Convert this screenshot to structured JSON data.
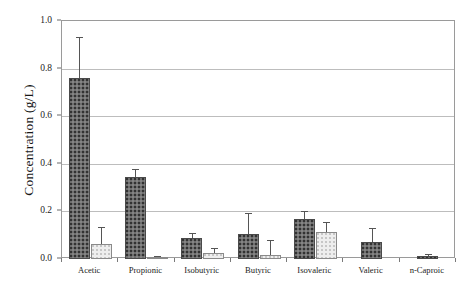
{
  "chart_data": {
    "type": "bar",
    "title": "",
    "xlabel": "",
    "ylabel": "Concentration (g/L)",
    "ylim": [
      0.0,
      1.0
    ],
    "yticks": [
      "0.0",
      "0.2",
      "0.4",
      "0.6",
      "0.8",
      "1.0"
    ],
    "ytick_values": [
      0.0,
      0.2,
      0.4,
      0.6,
      0.8,
      1.0
    ],
    "grid": "horizontal",
    "legend_position": "none",
    "categories": [
      "Acetic",
      "Propionic",
      "Isobutyric",
      "Butyric",
      "Isovaleric",
      "Valeric",
      "n-Caproic"
    ],
    "series": [
      {
        "name": "series-1",
        "style": "dark-speckled",
        "color": "#6e6e6e",
        "values": [
          0.76,
          0.345,
          0.09,
          0.105,
          0.17,
          0.07,
          0.012
        ],
        "errors": [
          0.172,
          0.032,
          0.018,
          0.088,
          0.033,
          0.06,
          0.009
        ]
      },
      {
        "name": "series-2",
        "style": "light",
        "color": "#eeeeee",
        "values": [
          0.065,
          0.008,
          0.025,
          0.018,
          0.115,
          null,
          null
        ],
        "errors": [
          0.07,
          0.006,
          0.023,
          0.06,
          0.04,
          null,
          null
        ]
      }
    ]
  }
}
